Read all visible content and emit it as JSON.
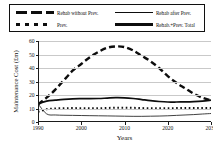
{
  "chart_data": {
    "type": "line",
    "title": "",
    "xlabel": "Years",
    "ylabel": "Maintenance Cost (£m)",
    "xlim": [
      1990,
      2030
    ],
    "ylim": [
      0,
      60
    ],
    "xticks": [
      1990,
      2000,
      2010,
      2020,
      2030
    ],
    "yticks": [
      0,
      10,
      20,
      30,
      40,
      50,
      60
    ],
    "grid": true,
    "legend_position": "top",
    "x": [
      1990,
      1992,
      1994,
      1996,
      1998,
      2000,
      2002,
      2004,
      2006,
      2008,
      2010,
      2012,
      2014,
      2016,
      2018,
      2020,
      2022,
      2024,
      2026,
      2028,
      2030
    ],
    "series": [
      {
        "name": "Rehab without Prev.",
        "style": "dashed-thick",
        "color": "#0d0d0d",
        "values": [
          13,
          18,
          24,
          31,
          38,
          43,
          48,
          52,
          55,
          56,
          55.5,
          53,
          49,
          45,
          40,
          34,
          29,
          25,
          21,
          18,
          16
        ]
      },
      {
        "name": "Rehab after Prev.",
        "style": "solid-thin",
        "color": "#2b2b2b",
        "values": [
          13.5,
          6,
          5.2,
          5,
          4.9,
          4.8,
          4.7,
          4.6,
          4.5,
          4.4,
          4.3,
          4.2,
          4.2,
          4.3,
          4.4,
          4.6,
          4.9,
          5.2,
          5.5,
          5.9,
          6.3
        ]
      },
      {
        "name": "Prev.",
        "style": "dotted",
        "color": "#121212",
        "values": [
          7.5,
          9.5,
          10,
          10.2,
          10.3,
          10.2,
          10.1,
          10.2,
          10.4,
          10.6,
          10.6,
          10.5,
          10.3,
          10.2,
          10.2,
          10.2,
          10.3,
          10.4,
          10.4,
          10.4,
          10.4
        ]
      },
      {
        "name": "Rehab.+Prev. Total",
        "style": "solid-thick",
        "color": "#0d0d0d",
        "values": [
          13.5,
          15.5,
          16.2,
          16.8,
          17.2,
          17.3,
          17.3,
          17.4,
          17.7,
          18,
          17.9,
          17.4,
          16.6,
          15.8,
          15.2,
          14.8,
          14.8,
          14.9,
          15.1,
          15.5,
          16.2
        ]
      }
    ]
  },
  "legend": {
    "entries": [
      {
        "label": "Rehab without Prev.",
        "style": "dashed-thick"
      },
      {
        "label": "Rehab after Prev.",
        "style": "solid-thin"
      },
      {
        "label": "Prev.",
        "style": "dotted"
      },
      {
        "label": "Rehab.+Prev. Total",
        "style": "solid-thick"
      }
    ]
  },
  "axes": {
    "y_title": "Maintenance Cost (£m)",
    "x_title": "Years",
    "y_tick_labels": [
      "60",
      "50",
      "40",
      "30",
      "20",
      "10",
      "0"
    ],
    "x_tick_labels": [
      "1990",
      "2000",
      "2010",
      "2020",
      "2030"
    ]
  }
}
